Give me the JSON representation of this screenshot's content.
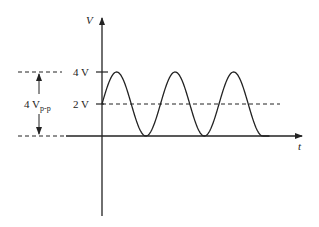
{
  "axes": {
    "y_label": "V",
    "x_label": "t"
  },
  "levels": {
    "max_label": "4 V",
    "mid_label": "2 V"
  },
  "amplitude": {
    "value": "4 V",
    "subscript": "p-p"
  },
  "waveform": {
    "type": "sinusoid with DC offset",
    "offset_v": 2,
    "peak_v": 4,
    "trough_v": 0,
    "cycles_shown": 3
  },
  "colors": {
    "stroke": "#222222",
    "background": "#ffffff"
  }
}
